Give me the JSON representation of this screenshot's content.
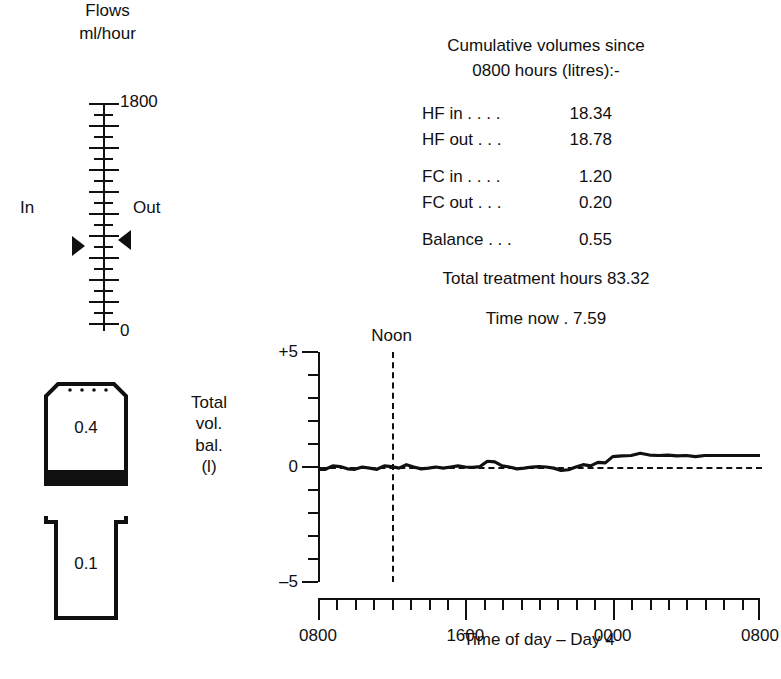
{
  "flows": {
    "title_line1": "Flows",
    "title_line2": "ml/hour",
    "top_label": "1800",
    "bottom_label": "0",
    "in_label": "In",
    "out_label": "Out",
    "units": "ml/hour",
    "scale_max": 1800,
    "scale_min": 0,
    "in_marker_value": 560,
    "out_marker_value": 620
  },
  "containers": {
    "bag": {
      "value": "0.4",
      "kind": "bag"
    },
    "beaker": {
      "value": "0.1",
      "kind": "beaker"
    }
  },
  "readout": {
    "heading_line1": "Cumulative volumes since",
    "heading_line2": "0800 hours (litres):-",
    "rows": [
      {
        "label": "HF in . . . .",
        "value": "18.34"
      },
      {
        "label": "HF out . . .",
        "value": "18.78"
      },
      {
        "label": "FC in . . . .",
        "value": "1.20"
      },
      {
        "label": "FC out . . .",
        "value": "0.20"
      },
      {
        "label": "Balance . . .",
        "value": "0.55"
      }
    ],
    "total_hours_label": "Total treatment hours",
    "total_hours_value": "83.32",
    "total_hours_line": "Total treatment hours 83.32",
    "time_now_label": "Time now .",
    "time_now_value": "7.59",
    "time_now_line": "Time now .    7.59"
  },
  "chart_data": {
    "type": "line",
    "title": "",
    "xlabel": "Time of day – Day 4",
    "ylabel": "Total vol. bal. (l)",
    "ylabel_lines": [
      "Total",
      "vol.",
      "bal.",
      "(l)"
    ],
    "ylim": [
      -5,
      5
    ],
    "ytick_labels": [
      "+5",
      "0",
      "–5"
    ],
    "ytick_values": [
      5,
      0,
      -5
    ],
    "yticks_all": [
      -5,
      -4,
      -3,
      -2,
      -1,
      0,
      1,
      2,
      3,
      4,
      5
    ],
    "xlim": [
      8,
      32
    ],
    "xtick_labels": [
      "0800",
      "1600",
      "0000",
      "0800"
    ],
    "xtick_values": [
      8,
      16,
      24,
      32
    ],
    "x_minor_step": 1,
    "grid": false,
    "legend": "none",
    "annotations": [
      {
        "text": "Noon",
        "x": 12,
        "style": "dashed-vertical"
      }
    ],
    "reference_line": {
      "y": 0,
      "style": "dashed",
      "x_start": 8,
      "x_end": 32
    },
    "series": [
      {
        "name": "Total volume balance",
        "x": [
          8.0,
          8.4,
          8.8,
          9.2,
          9.6,
          10.0,
          10.4,
          10.8,
          11.2,
          11.6,
          12.0,
          12.4,
          12.8,
          13.2,
          13.6,
          14.0,
          14.4,
          14.8,
          15.2,
          15.6,
          16.0,
          16.4,
          16.8,
          17.2,
          17.6,
          18.0,
          18.4,
          18.8,
          19.2,
          19.6,
          20.0,
          20.4,
          20.8,
          21.2,
          21.6,
          22.0,
          22.4,
          22.8,
          23.2,
          23.6,
          24.0,
          24.5,
          25.0,
          25.5,
          26.0,
          26.5,
          27.0,
          27.5,
          28.0,
          28.5,
          29.0,
          29.5,
          30.0,
          30.5,
          31.0,
          31.5,
          32.0
        ],
        "y": [
          -0.1,
          -0.1,
          0.05,
          0.02,
          -0.08,
          -0.1,
          0.0,
          -0.05,
          -0.1,
          0.05,
          0.02,
          -0.05,
          0.1,
          0.0,
          -0.08,
          -0.05,
          0.0,
          -0.05,
          0.0,
          0.05,
          0.0,
          -0.02,
          0.02,
          0.25,
          0.22,
          0.05,
          0.0,
          -0.08,
          -0.05,
          0.0,
          0.02,
          0.0,
          -0.05,
          -0.15,
          -0.12,
          0.0,
          0.1,
          0.05,
          0.2,
          0.18,
          0.45,
          0.48,
          0.5,
          0.6,
          0.52,
          0.5,
          0.52,
          0.48,
          0.5,
          0.45,
          0.5,
          0.5,
          0.5,
          0.5,
          0.5,
          0.5,
          0.5
        ]
      }
    ]
  }
}
